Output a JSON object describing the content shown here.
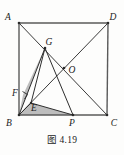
{
  "figure": {
    "caption": "图 4.19",
    "colors": {
      "stroke": "#3a3a3a",
      "square_stroke": "#555555",
      "shade_fill": "#b9b9b9",
      "background": "#fdfdfc",
      "label": "#1b1b1b"
    },
    "vertices": {
      "A": {
        "label": "A",
        "x": 19,
        "y": 23,
        "label_x": 8,
        "label_y": 20
      },
      "D": {
        "label": "D",
        "x": 108,
        "y": 23,
        "label_x": 110,
        "label_y": 20
      },
      "B": {
        "label": "B",
        "x": 19,
        "y": 115,
        "label_x": 7,
        "label_y": 126
      },
      "C": {
        "label": "C",
        "x": 107,
        "y": 115,
        "label_x": 111,
        "label_y": 126
      },
      "O": {
        "label": "O",
        "x": 64,
        "y": 68,
        "label_x": 69,
        "label_y": 73
      },
      "G": {
        "label": "G",
        "x": 45,
        "y": 48,
        "label_x": 45,
        "label_y": 45
      },
      "P": {
        "label": "P",
        "x": 73,
        "y": 115,
        "label_x": 70,
        "label_y": 126
      },
      "F": {
        "label": "F",
        "x": 23,
        "y": 95,
        "label_x": 13,
        "label_y": 96
      },
      "E": {
        "label": "E",
        "x": 31,
        "y": 103,
        "label_x": 31,
        "label_y": 111
      }
    },
    "segments": [
      {
        "name": "side-AD",
        "from": "A",
        "to": "D"
      },
      {
        "name": "side-DC",
        "from": "D",
        "to": "C"
      },
      {
        "name": "side-CB",
        "from": "C",
        "to": "B"
      },
      {
        "name": "side-BA",
        "from": "B",
        "to": "A"
      },
      {
        "name": "diagonal-AC",
        "from": "A",
        "to": "C"
      },
      {
        "name": "diagonal-BD",
        "from": "B",
        "to": "D"
      },
      {
        "name": "segment-GB",
        "from": "G",
        "to": "B"
      },
      {
        "name": "segment-GP",
        "from": "G",
        "to": "P"
      },
      {
        "name": "segment-GE",
        "from": "G",
        "to": "E"
      },
      {
        "name": "segment-EP",
        "from": "E",
        "to": "P"
      },
      {
        "name": "segment-BE",
        "from": "B",
        "to": "E"
      }
    ],
    "shaded_regions": [
      {
        "name": "triangle-G-F-B",
        "points": "G,F,B"
      },
      {
        "name": "triangle-B-E-P",
        "points": "B,E,P"
      }
    ],
    "right_angle_marks": [
      {
        "name": "right-angle-at-F",
        "x": 23,
        "y": 95
      }
    ]
  }
}
